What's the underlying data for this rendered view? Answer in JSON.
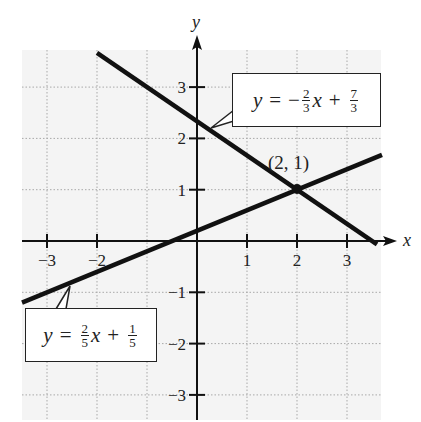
{
  "chart_data": {
    "type": "line",
    "title": "",
    "xlabel": "x",
    "ylabel": "y",
    "xlim": [
      -3.5,
      3.8
    ],
    "ylim": [
      -3.4,
      3.8
    ],
    "grid": true,
    "grid_style": "dotted",
    "x_ticks": [
      -3,
      -2,
      1,
      2,
      3
    ],
    "x_tick_labels": [
      "−3",
      "−2",
      "1",
      "2",
      "3"
    ],
    "y_ticks": [
      3,
      2,
      1,
      -1,
      -2,
      -3
    ],
    "y_tick_labels": [
      "3",
      "2",
      "1",
      "−1",
      "−2",
      "−3"
    ],
    "series": [
      {
        "name": "y = -2/3 x + 7/3",
        "slope": -0.6667,
        "intercept": 2.3333,
        "x": [
          -2,
          3.6
        ],
        "y": [
          3.667,
          -0.067
        ]
      },
      {
        "name": "y = 2/5 x + 1/5",
        "slope": 0.4,
        "intercept": 0.2,
        "x": [
          -3.5,
          3.7
        ],
        "y": [
          -1.2,
          1.68
        ]
      }
    ],
    "annotations": [
      {
        "type": "point",
        "x": 2,
        "y": 1,
        "label": "(2, 1)"
      },
      {
        "type": "callout",
        "text": "y = −(2/3)x + 7/3",
        "target_line": 0
      },
      {
        "type": "callout",
        "text": "y = (2/5)x + 1/5",
        "target_line": 1
      }
    ],
    "legend": "none"
  },
  "labels": {
    "x_axis": "x",
    "y_axis": "y",
    "point": "(2, 1)"
  },
  "equations": {
    "top": {
      "lhs": "y",
      "eq": "=",
      "sign": "−",
      "a_num": "2",
      "a_den": "3",
      "var": "x",
      "op": "+",
      "b_num": "7",
      "b_den": "3"
    },
    "bottom": {
      "lhs": "y",
      "eq": "=",
      "a_num": "2",
      "a_den": "5",
      "var": "x",
      "op": "+",
      "b_num": "1",
      "b_den": "5"
    }
  },
  "colors": {
    "background": "#ffffff",
    "grid_background": "#f4f4f4",
    "grid_line": "#a8a8a8",
    "line": "#111111",
    "axis": "#111111"
  }
}
